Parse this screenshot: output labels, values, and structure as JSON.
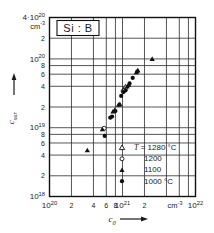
{
  "chart_data": {
    "type": "scatter",
    "title": "Si : B",
    "xlabel": "c_0",
    "ylabel": "c_sur",
    "x_unit": "cm-3",
    "y_unit": "cm-3",
    "xscale": "log",
    "yscale": "log",
    "xlim": [
      1e+20,
      1e+22
    ],
    "ylim": [
      1e+18,
      4e+20
    ],
    "grid": true,
    "x_ticklabels": [
      {
        "value": 1e+20,
        "label": "10",
        "exp": "20"
      },
      {
        "value": 2e+20,
        "label": "2",
        "exp": ""
      },
      {
        "value": 4e+20,
        "label": "4",
        "exp": ""
      },
      {
        "value": 6e+20,
        "label": "6",
        "exp": ""
      },
      {
        "value": 8e+20,
        "label": "8",
        "exp": ""
      },
      {
        "value": 1e+21,
        "label": "10",
        "exp": "21"
      },
      {
        "value": 2e+21,
        "label": "2",
        "exp": ""
      },
      {
        "value": 1e+22,
        "label": "10",
        "exp": "22"
      }
    ],
    "y_ticklabels": [
      {
        "value": 4e+20,
        "label": "4·10",
        "exp": "20"
      },
      {
        "value": 2e+20,
        "label": "2",
        "exp": ""
      },
      {
        "value": 1e+20,
        "label": "10",
        "exp": "20"
      },
      {
        "value": 8e+19,
        "label": "8",
        "exp": ""
      },
      {
        "value": 6e+19,
        "label": "6",
        "exp": ""
      },
      {
        "value": 4e+19,
        "label": "4",
        "exp": ""
      },
      {
        "value": 2e+19,
        "label": "2",
        "exp": ""
      },
      {
        "value": 1e+19,
        "label": "10",
        "exp": "19"
      },
      {
        "value": 8e+18,
        "label": "8",
        "exp": ""
      },
      {
        "value": 6e+18,
        "label": "6",
        "exp": ""
      },
      {
        "value": 4e+18,
        "label": "4",
        "exp": ""
      },
      {
        "value": 2e+18,
        "label": "2",
        "exp": ""
      },
      {
        "value": 1e+18,
        "label": "10",
        "exp": "18"
      }
    ],
    "x_gridlines": [
      1e+20,
      2e+20,
      4e+20,
      6e+20,
      8e+20,
      1e+21,
      2e+21,
      4e+21,
      6e+21,
      8e+21,
      1e+22
    ],
    "y_gridlines": [
      4e+20,
      2e+20,
      1e+20,
      8e+19,
      6e+19,
      4e+19,
      2e+19,
      1e+19,
      8e+18,
      6e+18,
      4e+18,
      2e+18,
      1e+18
    ],
    "legend": {
      "position": "lower-right-inside",
      "entries": [
        {
          "marker": "open-triangle",
          "label": "T = 1280 °C",
          "temperature": 1280
        },
        {
          "marker": "open-circle",
          "label": "1200",
          "temperature": 1200
        },
        {
          "marker": "filled-triangle",
          "label": "1100",
          "temperature": 1100
        },
        {
          "marker": "filled-circle",
          "label": "1000 °C",
          "temperature": 1000
        }
      ]
    },
    "series": [
      {
        "name": "T = 1280 °C",
        "marker": "open-triangle",
        "points": [
          {
            "x": 1.05e+21,
            "y": 3.6e+19
          },
          {
            "x": 1.1e+21,
            "y": 3.9e+19
          }
        ]
      },
      {
        "name": "1200",
        "marker": "open-circle",
        "points": [
          {
            "x": 5.6e+20,
            "y": 9.8e+18
          },
          {
            "x": 1.02e+21,
            "y": 3.4e+19
          },
          {
            "x": 1.06e+21,
            "y": 3.5e+19
          }
        ]
      },
      {
        "name": "1100",
        "marker": "filled-triangle",
        "points": [
          {
            "x": 3.3e+20,
            "y": 4.7e+18
          },
          {
            "x": 5.3e+20,
            "y": 9.5e+18
          },
          {
            "x": 7.4e+20,
            "y": 1.72e+19
          },
          {
            "x": 7.8e+20,
            "y": 1.8e+19
          },
          {
            "x": 8.8e+20,
            "y": 2.15e+19
          },
          {
            "x": 9.2e+20,
            "y": 2.2e+19
          },
          {
            "x": 1.16e+21,
            "y": 4e+19
          },
          {
            "x": 1.22e+21,
            "y": 4.2e+19
          },
          {
            "x": 1.55e+21,
            "y": 6.4e+19
          },
          {
            "x": 1.62e+21,
            "y": 6.8e+19
          },
          {
            "x": 2.55e+21,
            "y": 1e+20
          }
        ]
      },
      {
        "name": "1000 °C",
        "marker": "filled-circle",
        "points": [
          {
            "x": 5.7e+20,
            "y": 7.6e+18
          },
          {
            "x": 6.8e+20,
            "y": 1.4e+19
          },
          {
            "x": 7.2e+20,
            "y": 1.45e+19
          },
          {
            "x": 8e+20,
            "y": 1.75e+19
          },
          {
            "x": 9.6e+20,
            "y": 2.9e+19
          },
          {
            "x": 1.03e+21,
            "y": 3.3e+19
          },
          {
            "x": 1.1e+21,
            "y": 3.5e+19
          },
          {
            "x": 1.25e+21,
            "y": 4.4e+19
          },
          {
            "x": 1.38e+21,
            "y": 5.3e+19
          },
          {
            "x": 1.6e+21,
            "y": 6.6e+19
          }
        ]
      }
    ]
  }
}
